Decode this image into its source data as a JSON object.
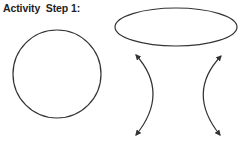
{
  "title": "Activity  Step 1:",
  "shapes": {
    "circle": {
      "cx": 57,
      "cy": 74,
      "r": 44
    },
    "ellipse": {
      "cx": 176,
      "cy": 27,
      "rx": 61,
      "ry": 19
    },
    "hyperbola_left": {
      "label": "left-branch"
    },
    "hyperbola_right": {
      "label": "right-branch"
    }
  },
  "colors": {
    "stroke": "#333333"
  }
}
